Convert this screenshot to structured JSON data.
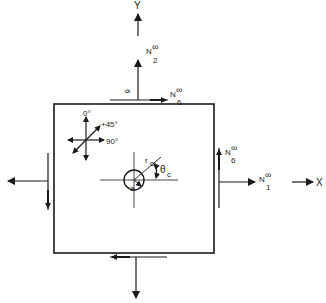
{
  "diagram": {
    "type": "plate-with-hole-loading-schematic",
    "colors": {
      "ink": "#1a1a1a",
      "background": "#ffffff"
    },
    "axes": {
      "y_label": "Y",
      "x_label": "X"
    },
    "loads": {
      "n2": {
        "base": "N",
        "sub": "2",
        "sup": "∞"
      },
      "n1": {
        "base": "N",
        "sub": "1",
        "sup": "∞"
      },
      "n6_top": {
        "base": "N",
        "sub": "6",
        "sup": "∞"
      },
      "n6_right": {
        "base": "N",
        "sub": "6",
        "sup": "∞"
      },
      "top_rotated_label": "6"
    },
    "ply_orientation": {
      "zero": "0°",
      "plus45": "+45°",
      "ninety": "90°"
    },
    "hole": {
      "radius_label": "a",
      "r_c_base": "r",
      "r_c_sub": "c",
      "theta_c_base": "θ",
      "theta_c_sub": "c"
    }
  }
}
